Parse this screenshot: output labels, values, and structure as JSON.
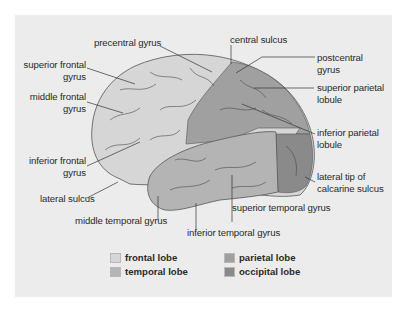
{
  "figure": {
    "panel_background": "#ececec"
  },
  "labels": {
    "precentral_gyrus": "precentral gyrus",
    "central_sulcus": "central sulcus",
    "superior_frontal_gyrus_1": "superior frontal",
    "superior_frontal_gyrus_2": "gyrus",
    "middle_frontal_gyrus_1": "middle frontal",
    "middle_frontal_gyrus_2": "gyrus",
    "inferior_frontal_gyrus_1": "inferior frontal",
    "inferior_frontal_gyrus_2": "gyrus",
    "lateral_sulcus": "lateral sulcus",
    "middle_temporal_gyrus": "middle temporal gyrus",
    "inferior_temporal_gyrus": "inferior temporal gyrus",
    "superior_temporal_gyrus": "superior temporal gyrus",
    "postcentral_gyrus_1": "postcentral",
    "postcentral_gyrus_2": "gyrus",
    "superior_parietal_lobule_1": "superior parietal",
    "superior_parietal_lobule_2": "lobule",
    "inferior_parietal_lobule_1": "inferior parietal",
    "inferior_parietal_lobule_2": "lobule",
    "calcarine_1": "lateral tip of",
    "calcarine_2": "calcarine sulcus"
  },
  "legend": {
    "items": [
      {
        "label": "frontal lobe",
        "color": "#d6d6d6"
      },
      {
        "label": "temporal lobe",
        "color": "#b4b4b4"
      },
      {
        "label": "parietal lobe",
        "color": "#a0a0a0"
      },
      {
        "label": "occipital lobe",
        "color": "#8a8a8a"
      }
    ]
  }
}
